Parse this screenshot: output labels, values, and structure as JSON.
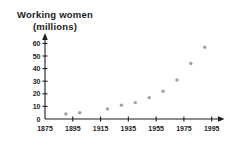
{
  "chart": {
    "title_lines": [
      "Working women",
      "(millions)"
    ]
  },
  "chart_data": {
    "type": "scatter",
    "title": "Working women (millions)",
    "xlabel": "",
    "ylabel": "Working women (millions)",
    "x": [
      1890,
      1900,
      1920,
      1930,
      1940,
      1950,
      1960,
      1970,
      1980,
      1990
    ],
    "values": [
      4,
      5,
      8,
      11,
      13,
      17,
      22,
      31,
      44,
      57
    ],
    "x_ticks": [
      1875,
      1895,
      1915,
      1935,
      1955,
      1975,
      1995
    ],
    "y_ticks": [
      0,
      10,
      20,
      30,
      40,
      50,
      60
    ],
    "xlim": [
      1875,
      2000
    ],
    "ylim": [
      0,
      65
    ],
    "grid": false,
    "legend": null,
    "point_color": "#a0a0a0",
    "axis_color": "#1c1c24",
    "background_color": "#ffffff"
  }
}
